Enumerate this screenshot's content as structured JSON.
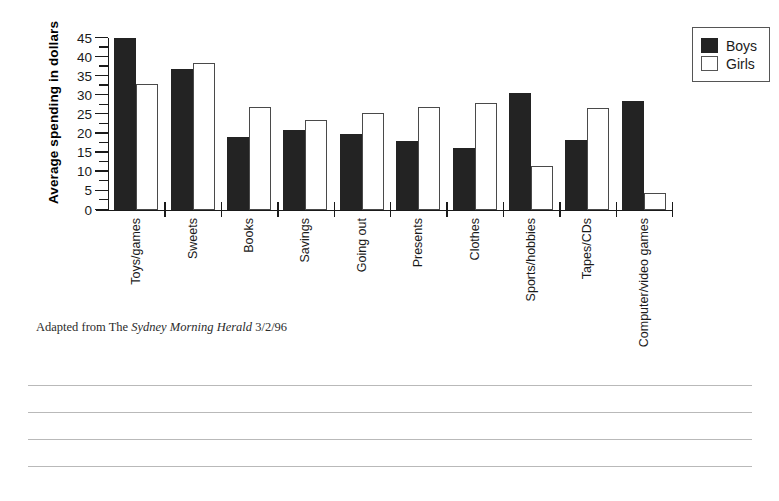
{
  "chart_data": {
    "type": "bar",
    "title": "",
    "xlabel": "",
    "ylabel": "Average spending in dollars",
    "ylim": [
      0,
      45
    ],
    "ytick_step": 5,
    "grid": false,
    "legend_position": "top-right",
    "categories": [
      "Toys/games",
      "Sweets",
      "Books",
      "Savings",
      "Going out",
      "Presents",
      "Clothes",
      "Sports/hobbies",
      "Tapes/CDs",
      "Computer/video games"
    ],
    "ytick_labels": [
      "0",
      "5",
      "10",
      "15",
      "20",
      "25",
      "30",
      "35",
      "40",
      "45"
    ],
    "ytick_values": [
      0,
      5,
      10,
      15,
      20,
      25,
      30,
      35,
      40,
      45
    ],
    "series": [
      {
        "name": "Boys",
        "color": "#232323",
        "values": [
          45,
          37,
          19,
          21,
          20,
          18,
          16.3,
          30.5,
          18.2,
          28.5
        ]
      },
      {
        "name": "Girls",
        "color": "#ffffff",
        "values": [
          33,
          38.5,
          27,
          23.5,
          25.5,
          27,
          28,
          11.5,
          26.7,
          4.5
        ]
      }
    ]
  },
  "legend": {
    "items": [
      {
        "label": "Boys",
        "swatch": "filled-black"
      },
      {
        "label": "Girls",
        "swatch": "outlined-white"
      }
    ]
  },
  "caption": {
    "prefix": "Adapted from The ",
    "source": "Sydney Morning Herald",
    "date": " 3/2/96"
  },
  "ruled_lines": {
    "count": 4
  }
}
